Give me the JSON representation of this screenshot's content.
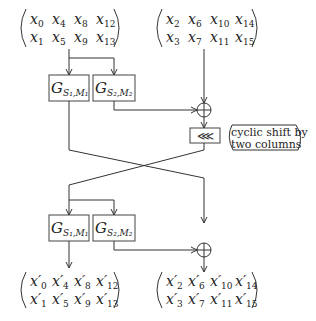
{
  "diagram": {
    "input_left": {
      "rows": [
        [
          "x0",
          "x4",
          "x8",
          "x12"
        ],
        [
          "x1",
          "x5",
          "x9",
          "x13"
        ]
      ],
      "display": [
        [
          [
            "x",
            "0"
          ],
          [
            "x",
            "4"
          ],
          [
            "x",
            "8"
          ],
          [
            "x",
            "12"
          ]
        ],
        [
          [
            "x",
            "1"
          ],
          [
            "x",
            "5"
          ],
          [
            "x",
            "9"
          ],
          [
            "x",
            "13"
          ]
        ]
      ]
    },
    "input_right": {
      "display": [
        [
          [
            "x",
            "2"
          ],
          [
            "x",
            "6"
          ],
          [
            "x",
            "10"
          ],
          [
            "x",
            "14"
          ]
        ],
        [
          [
            "x",
            "3"
          ],
          [
            "x",
            "7"
          ],
          [
            "x",
            "11"
          ],
          [
            "x",
            "15"
          ]
        ]
      ]
    },
    "output_left": {
      "display": [
        [
          [
            "x′",
            "0"
          ],
          [
            "x′",
            "4"
          ],
          [
            "x′",
            "8"
          ],
          [
            "x′",
            "12"
          ]
        ],
        [
          [
            "x′",
            "1"
          ],
          [
            "x′",
            "5"
          ],
          [
            "x′",
            "9"
          ],
          [
            "x′",
            "13"
          ]
        ]
      ]
    },
    "output_right": {
      "display": [
        [
          [
            "x′",
            "2"
          ],
          [
            "x′",
            "6"
          ],
          [
            "x′",
            "10"
          ],
          [
            "x′",
            "14"
          ]
        ],
        [
          [
            "x′",
            "3"
          ],
          [
            "x′",
            "7"
          ],
          [
            "x′",
            "11"
          ],
          [
            "x′",
            "15"
          ]
        ]
      ]
    },
    "g1": {
      "base": "G",
      "sub": "S₁,M₁"
    },
    "g2": {
      "base": "G",
      "sub": "S₂,M₂"
    },
    "xor_symbol": "⊕",
    "shift_symbol": "⋘",
    "shift_label_line1": "cyclic shift by",
    "shift_label_line2": "two columns"
  }
}
